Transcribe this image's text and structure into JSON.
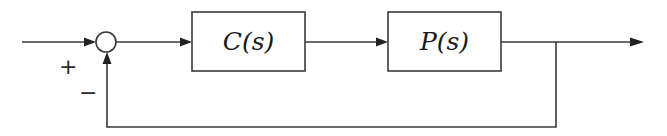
{
  "diagram": {
    "type": "feedback-control-block-diagram",
    "blocks": [
      {
        "id": "controller",
        "label": "C(s)"
      },
      {
        "id": "plant",
        "label": "P(s)"
      }
    ],
    "summing_junction": {
      "signs": {
        "reference": "+",
        "feedback": "−"
      }
    },
    "connections": [
      {
        "from": "input",
        "to": "summing_junction",
        "arrow": true
      },
      {
        "from": "summing_junction",
        "to": "controller",
        "arrow": true
      },
      {
        "from": "controller",
        "to": "plant",
        "arrow": true
      },
      {
        "from": "plant",
        "to": "output",
        "arrow": true
      },
      {
        "from": "output",
        "to": "summing_junction",
        "arrow": true,
        "kind": "feedback"
      }
    ],
    "colors": {
      "line": "#3a3a3a",
      "arrowhead": "#222222",
      "background": "#ffffff"
    }
  }
}
